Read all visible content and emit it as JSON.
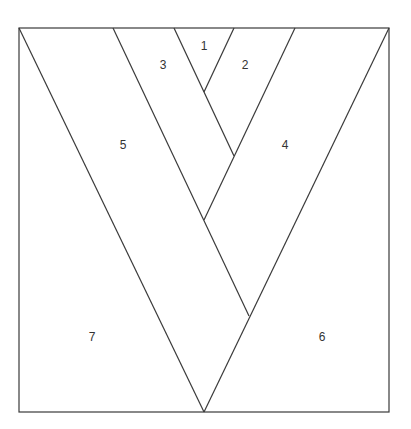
{
  "diagram": {
    "type": "paper-piecing-pattern",
    "frame": {
      "x": 19,
      "y": 28,
      "width": 370,
      "height": 384
    },
    "line_color": "#3a3a3a",
    "lines": [
      {
        "x1": 19,
        "y1": 28,
        "x2": 204,
        "y2": 412
      },
      {
        "x1": 389,
        "y1": 28,
        "x2": 204,
        "y2": 412
      },
      {
        "x1": 113,
        "y1": 28,
        "x2": 249,
        "y2": 316
      },
      {
        "x1": 295,
        "y1": 28,
        "x2": 204,
        "y2": 220
      },
      {
        "x1": 174,
        "y1": 28,
        "x2": 234,
        "y2": 156
      },
      {
        "x1": 234,
        "y1": 28,
        "x2": 204,
        "y2": 92
      }
    ],
    "labels": [
      {
        "text": "1",
        "x": 204,
        "y": 50
      },
      {
        "text": "2",
        "x": 245,
        "y": 69
      },
      {
        "text": "3",
        "x": 163,
        "y": 69
      },
      {
        "text": "4",
        "x": 285,
        "y": 149
      },
      {
        "text": "5",
        "x": 123,
        "y": 149
      },
      {
        "text": "6",
        "x": 322,
        "y": 341
      },
      {
        "text": "7",
        "x": 92,
        "y": 341
      }
    ]
  }
}
